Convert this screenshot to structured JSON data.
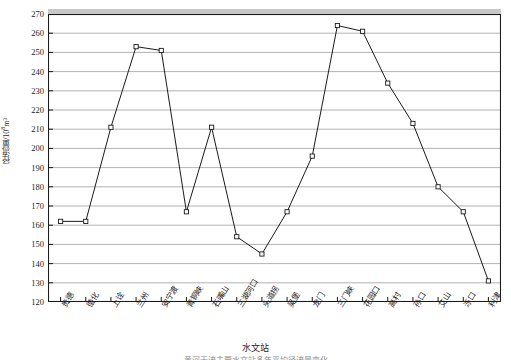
{
  "chart_data": {
    "type": "line",
    "title": "",
    "xlabel": "水文站",
    "ylabel": "径流量/10⁸m³",
    "ylim": [
      120,
      270
    ],
    "ytick_step": 10,
    "grid": true,
    "legend": null,
    "marker": "open-square",
    "line_color": "#1a1a1a",
    "grid_color": "#9e9e9e",
    "axis_color": "#1a1a1a",
    "categories": [
      "贵德",
      "循化",
      "上诠",
      "兰州",
      "安宁渡",
      "青铜峡",
      "石嘴山",
      "三湖河口",
      "头道拐",
      "吴堡",
      "龙门",
      "三门峡",
      "花园口",
      "高村",
      "孙口",
      "艾山",
      "泺口",
      "利津"
    ],
    "values": [
      162,
      162,
      211,
      253,
      251,
      167,
      211,
      154,
      145,
      167,
      196,
      264,
      261,
      234,
      213,
      180,
      167,
      131
    ],
    "yticks": [
      120,
      130,
      140,
      150,
      160,
      170,
      180,
      190,
      200,
      210,
      220,
      230,
      240,
      250,
      260,
      270
    ]
  },
  "axis": {
    "y_title": "径流量/10",
    "y_title_sup": "8",
    "y_title_unit": "m³",
    "x_title": "水文站"
  },
  "caption": {
    "sliver": "黄河干流主要水文站多年平均径流量变化"
  }
}
